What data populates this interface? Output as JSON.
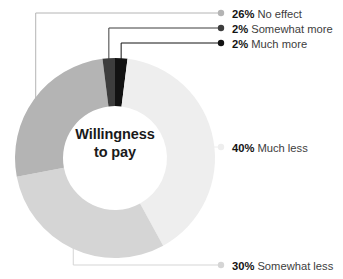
{
  "chart_data": {
    "type": "pie",
    "variant": "donut",
    "title": "Willingness to pay",
    "center_label_line1": "Willingness",
    "center_label_line2": "to pay",
    "xlabel": "",
    "ylabel": "",
    "legend_position": "right-callout",
    "grid": false,
    "units": "percent",
    "total": 100,
    "categories": [
      "No effect",
      "Somewhat more",
      "Much more",
      "Much less",
      "Somewhat less"
    ],
    "values": [
      26,
      2,
      2,
      40,
      30
    ],
    "slices": [
      {
        "label": "No effect",
        "value": 26,
        "value_text": "26%",
        "color": "#b4b4b4",
        "legend_x": 232,
        "legend_y": 14,
        "dot_x": 221,
        "dot_y": 13,
        "dot_r": 3.2
      },
      {
        "label": "Somewhat more",
        "value": 2,
        "value_text": "2%",
        "color": "#3d3d3d",
        "legend_x": 232,
        "legend_y": 29,
        "dot_x": 221,
        "dot_y": 28,
        "dot_r": 3.2
      },
      {
        "label": "Much more",
        "value": 2,
        "value_text": "2%",
        "color": "#121212",
        "legend_x": 232,
        "legend_y": 44,
        "dot_x": 221,
        "dot_y": 43,
        "dot_r": 3.2
      },
      {
        "label": "Much less",
        "value": 40,
        "value_text": "40%",
        "color": "#eeeeee",
        "legend_x": 232,
        "legend_y": 148,
        "dot_x": 221,
        "dot_y": 147,
        "dot_r": 3.2
      },
      {
        "label": "Somewhat less",
        "value": 30,
        "value_text": "30%",
        "color": "#d5d5d5",
        "legend_x": 232,
        "legend_y": 266,
        "dot_x": 221,
        "dot_y": 265,
        "dot_r": 3.2
      }
    ],
    "geometry": {
      "cx": 115,
      "cy": 158,
      "outer_r": 100,
      "inner_r": 52,
      "start_angle_deg": -90
    },
    "background_color": "#ffffff"
  }
}
